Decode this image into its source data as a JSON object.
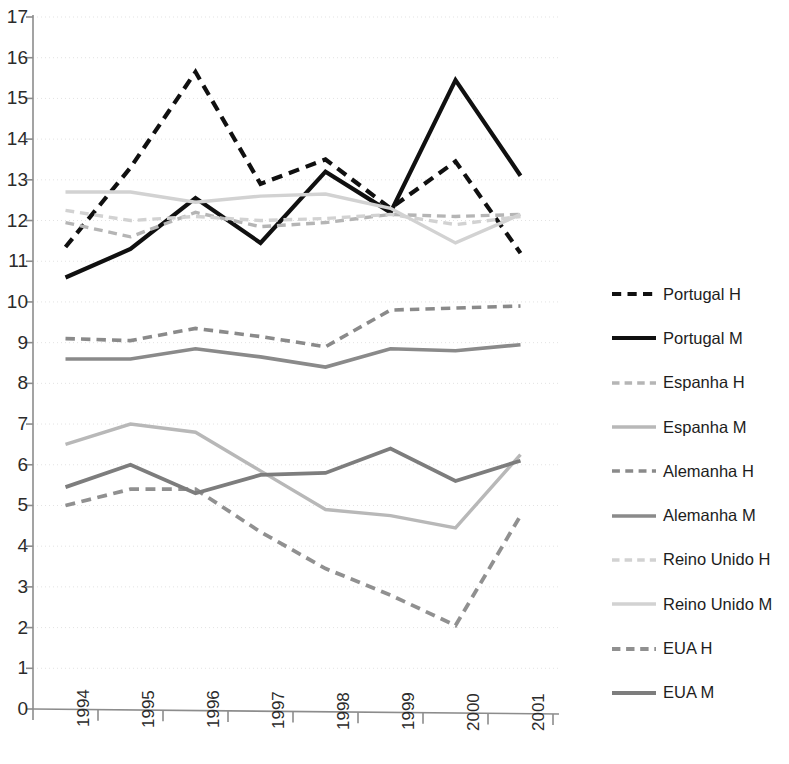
{
  "chart_data": {
    "type": "line",
    "title": "",
    "xlabel": "",
    "ylabel": "",
    "categories": [
      "1994",
      "1995",
      "1996",
      "1997",
      "1998",
      "1999",
      "2000",
      "2001"
    ],
    "ylim": [
      0,
      17
    ],
    "xlim": [
      "1994",
      "2001"
    ],
    "grid": true,
    "legend_position": "right",
    "ytick_labels": [
      "17",
      "16",
      "15",
      "14",
      "13",
      "12",
      "11",
      "10",
      "9",
      "8",
      "7",
      "6",
      "5",
      "4",
      "3",
      "2",
      "1",
      "0"
    ],
    "series": [
      {
        "name": "Portugal H",
        "color": "#101010",
        "style": "dashed",
        "width": 4.2,
        "values": [
          11.35,
          13.3,
          15.65,
          12.9,
          13.5,
          12.3,
          13.45,
          11.2
        ]
      },
      {
        "name": "Portugal M",
        "color": "#101010",
        "style": "solid",
        "width": 4.2,
        "values": [
          10.6,
          11.3,
          12.55,
          11.45,
          13.2,
          12.2,
          15.45,
          13.1
        ]
      },
      {
        "name": "Espanha H",
        "color": "#b5b5b5",
        "style": "dashed",
        "width": 3.4,
        "values": [
          11.95,
          11.6,
          12.2,
          11.85,
          11.95,
          12.15,
          12.1,
          12.15
        ]
      },
      {
        "name": "Espanha M",
        "color": "#b8b8b8",
        "style": "solid",
        "width": 3.4,
        "values": [
          6.5,
          7.0,
          6.8,
          5.85,
          4.9,
          4.75,
          4.45,
          6.25
        ]
      },
      {
        "name": "Alemanha H",
        "color": "#8a8a8a",
        "style": "dashed",
        "width": 3.6,
        "values": [
          9.1,
          9.05,
          9.35,
          9.15,
          8.9,
          9.8,
          9.85,
          9.9
        ]
      },
      {
        "name": "Alemanha M",
        "color": "#8a8a8a",
        "style": "solid",
        "width": 3.6,
        "values": [
          8.6,
          8.6,
          8.85,
          8.65,
          8.4,
          8.85,
          8.8,
          8.95
        ]
      },
      {
        "name": "Reino Unido H",
        "color": "#d2d2d2",
        "style": "dashed",
        "width": 3.4,
        "values": [
          12.25,
          12.0,
          12.1,
          12.0,
          12.05,
          12.15,
          11.9,
          12.1
        ]
      },
      {
        "name": "Reino Unido M",
        "color": "#d2d2d2",
        "style": "solid",
        "width": 3.4,
        "values": [
          12.7,
          12.7,
          12.45,
          12.6,
          12.65,
          12.3,
          11.45,
          12.15
        ]
      },
      {
        "name": "EUA H",
        "color": "#909090",
        "style": "dashed",
        "width": 3.8,
        "values": [
          5.0,
          5.4,
          5.4,
          4.35,
          3.45,
          2.8,
          2.05,
          4.75
        ]
      },
      {
        "name": "EUA M",
        "color": "#7d7d7d",
        "style": "solid",
        "width": 3.8,
        "values": [
          5.45,
          6.0,
          5.3,
          5.75,
          5.8,
          6.4,
          5.6,
          6.1
        ]
      }
    ]
  },
  "axis": {
    "color": "#8c8c8c",
    "gridline_color": "#e3e3e3"
  },
  "legend": {
    "entries": [
      {
        "label": "Portugal H"
      },
      {
        "label": "Portugal M"
      },
      {
        "label": "Espanha H"
      },
      {
        "label": "Espanha M"
      },
      {
        "label": "Alemanha H"
      },
      {
        "label": "Alemanha M"
      },
      {
        "label": "Reino Unido H"
      },
      {
        "label": "Reino Unido M"
      },
      {
        "label": "EUA H"
      },
      {
        "label": "EUA M"
      }
    ]
  }
}
